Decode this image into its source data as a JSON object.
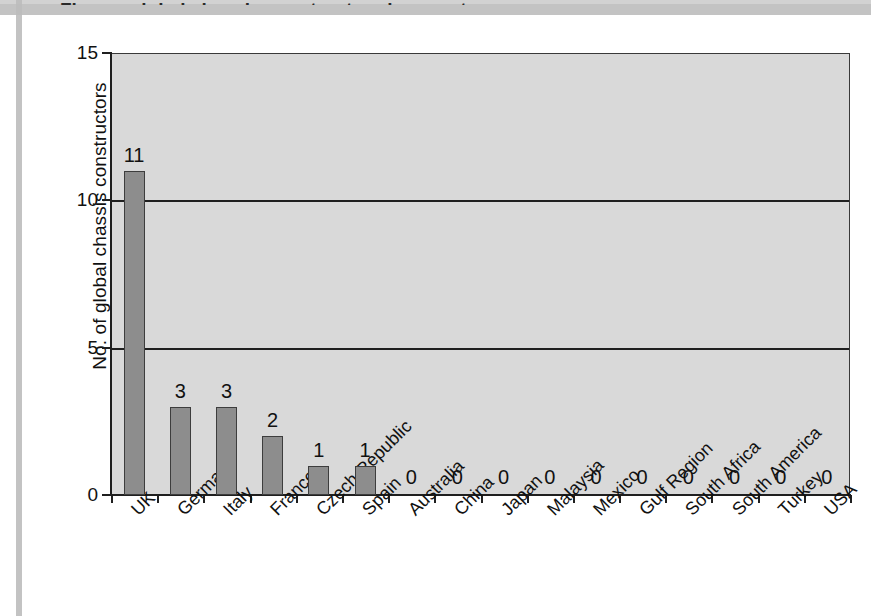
{
  "page": {
    "width": 871,
    "height": 616,
    "background": "#ffffff",
    "title_remnant": "Figure: global chassis constructors by country"
  },
  "chart_data": {
    "type": "bar",
    "title": "",
    "subtitle": "",
    "xlabel": "",
    "ylabel": "No. of global chassis constructors",
    "ylim": [
      0,
      15
    ],
    "yticks": [
      0,
      5,
      10,
      15
    ],
    "ytick_labels": [
      "0",
      "5",
      "10",
      "15"
    ],
    "grid": true,
    "grid_axis": "y",
    "legend": false,
    "legend_position": "none",
    "categories": [
      "UK",
      "Germany",
      "Italy",
      "France",
      "Czech Republic",
      "Spain",
      "Australia",
      "China",
      "Japan",
      "Malaysia",
      "Mexico",
      "Gulf Region",
      "South Africa",
      "South America",
      "Turkey",
      "USA"
    ],
    "values": [
      11,
      3,
      3,
      2,
      1,
      1,
      0,
      0,
      0,
      0,
      0,
      0,
      0,
      0,
      0,
      0
    ],
    "data_labels": [
      "11",
      "3",
      "3",
      "2",
      "1",
      "1",
      "0",
      "0",
      "0",
      "0",
      "0",
      "0",
      "0",
      "0",
      "0",
      "0"
    ],
    "colors": {
      "bar_fill": "#8d8d8d",
      "bar_stroke": "#3d3d3d",
      "plot_background": "#d9d9d9",
      "axis": "#1f1f1f",
      "gridline": "#1f1f1f",
      "text": "#111111",
      "page_background": "#ffffff"
    }
  }
}
